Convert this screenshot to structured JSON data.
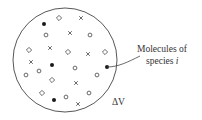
{
  "diagram": {
    "volume_label": "ΔV",
    "callout": {
      "line1": "Molecules of",
      "line2_prefix": "species ",
      "line2_var": "i"
    },
    "boundary": {
      "cx": 65,
      "cy": 60,
      "r": 52
    },
    "colors": {
      "stroke": "#444444",
      "fill": "#1a1a1a",
      "text": "#333333"
    },
    "molecules": {
      "species_i_filled": [
        [
          44,
          24
        ],
        [
          52,
          65
        ],
        [
          107,
          67
        ],
        [
          54,
          100
        ]
      ],
      "diamonds": [
        [
          59,
          18
        ],
        [
          29,
          50
        ],
        [
          68,
          52
        ],
        [
          105,
          52
        ],
        [
          52,
          80
        ],
        [
          42,
          93
        ]
      ],
      "open_circles": [
        [
          46,
          35
        ],
        [
          90,
          35
        ],
        [
          39,
          71
        ],
        [
          26,
          75
        ],
        [
          75,
          68
        ],
        [
          97,
          75
        ],
        [
          66,
          97
        ],
        [
          89,
          93
        ]
      ],
      "crosses": [
        [
          81,
          18
        ],
        [
          70,
          33
        ],
        [
          50,
          48
        ],
        [
          88,
          54
        ],
        [
          31,
          62
        ],
        [
          76,
          83
        ],
        [
          78,
          104
        ]
      ]
    },
    "highlighted_molecule": [
      107,
      67
    ]
  }
}
